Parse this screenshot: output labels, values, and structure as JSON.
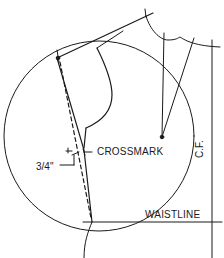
{
  "diagram": {
    "type": "sewing-pattern-draft",
    "labels": {
      "crossmark": "CROSSMARK",
      "measurement": "3/4\"",
      "waistline": "WAISTLINE",
      "center_front": "C.F."
    },
    "colors": {
      "line": "#1a1a1a",
      "background": "#ffffff"
    },
    "elements": [
      "guide-circle",
      "shoulder-line",
      "neckline-curve",
      "armhole-curve",
      "side-seam",
      "dashed-original-side-seam",
      "bust-dart",
      "center-front-line",
      "waistline",
      "crossmark-notch",
      "measurement-callout"
    ]
  }
}
